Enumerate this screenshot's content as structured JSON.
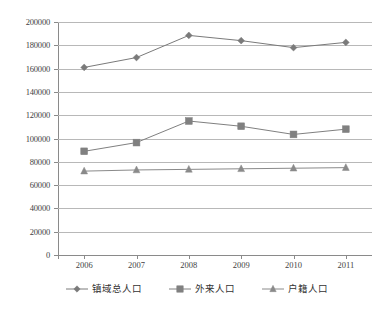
{
  "chart_data": {
    "type": "line",
    "title": "",
    "subtitle": "",
    "xlabel": "",
    "ylabel": "",
    "categories": [
      "2006",
      "2007",
      "2008",
      "2009",
      "2010",
      "2011"
    ],
    "ylim": [
      0,
      200000
    ],
    "ytick_step": 20000,
    "yticks": [
      "0",
      "20000",
      "40000",
      "60000",
      "80000",
      "100000",
      "120000",
      "140000",
      "160000",
      "180000",
      "200000"
    ],
    "grid": true,
    "legend_position": "bottom",
    "series": [
      {
        "name": "镇域总人口",
        "marker": "diamond",
        "color": "#7a7a7a",
        "values": [
          161000,
          169500,
          188500,
          184000,
          178000,
          182500
        ]
      },
      {
        "name": "外来人口",
        "marker": "square",
        "color": "#808080",
        "values": [
          89000,
          96500,
          115000,
          110500,
          103500,
          108000
        ]
      },
      {
        "name": "户籍人口",
        "marker": "triangle",
        "color": "#8a8a8a",
        "values": [
          72000,
          73000,
          73500,
          74000,
          74500,
          75000
        ]
      }
    ]
  },
  "colors": {
    "grid": "#b8b8b8",
    "axis": "#8a8a8a",
    "text": "#3f3f3f",
    "background": "#ffffff"
  }
}
